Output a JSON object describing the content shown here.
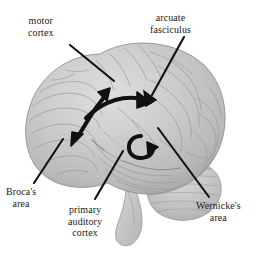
{
  "figure": {
    "background_color": "#ffffff",
    "ink_color": "#111111",
    "brain_fill": "#c9c9c9"
  },
  "labels": {
    "motor_cortex": {
      "line1": "motor",
      "line2": "cortex"
    },
    "arcuate_fasciculus": {
      "line1": "arcuate",
      "line2": "fasciculus"
    },
    "brocas_area": {
      "line1": "Broca's",
      "line2": "area"
    },
    "primary_auditory_cortex": {
      "line1": "primary",
      "line2": "auditory",
      "line3": "cortex"
    },
    "wernickes_area": {
      "line1": "Wernicke's",
      "line2": "area"
    }
  },
  "leader_lines": [
    {
      "name": "motor-cortex-leader",
      "from": [
        70,
        45
      ],
      "to": [
        112,
        80
      ],
      "arrow": false
    },
    {
      "name": "arcuate-fasciculus-leader",
      "from": [
        183,
        38
      ],
      "to": [
        148,
        97
      ],
      "arrow": true
    },
    {
      "name": "brocas-area-leader",
      "from": [
        33,
        184
      ],
      "to": [
        62,
        140
      ],
      "arrow": false
    },
    {
      "name": "primary-auditory-leader",
      "from": [
        95,
        200
      ],
      "to": [
        122,
        152
      ],
      "arrow": false
    },
    {
      "name": "wernickes-area-leader",
      "from": [
        208,
        198
      ],
      "to": [
        160,
        131
      ],
      "arrow": false
    }
  ],
  "pathway_arrows": [
    {
      "name": "arcuate-pathway-arc",
      "description": "long curved arc from Broca's region to Wernicke's region",
      "arrow": true
    },
    {
      "name": "motor-cortex-arrow",
      "description": "arrow pointing up to motor cortex",
      "arrow": true
    },
    {
      "name": "brocas-arrow",
      "description": "arrow pointing down-left to Broca's area",
      "arrow": true
    },
    {
      "name": "wernickes-hook-arrow",
      "description": "small hooked arrow near Wernicke's area",
      "arrow": true
    }
  ]
}
